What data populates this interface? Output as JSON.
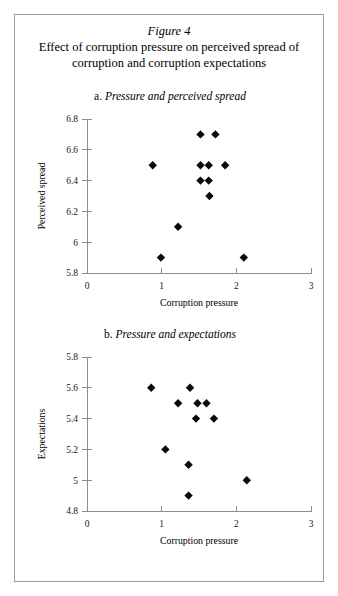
{
  "figure": {
    "number_label": "Figure 4",
    "title": "Effect of corruption pressure on perceived spread of corruption and corruption expectations",
    "title_line1": "Effect of corruption pressure on perceived spread of",
    "title_line2": "corruption and corruption expectations"
  },
  "panel_a": {
    "letter": "a.",
    "title_text": "Pressure and perceived spread",
    "full_title": "a. Pressure and perceived spread"
  },
  "panel_b": {
    "letter": "b.",
    "title_text": "Pressure and expectations",
    "full_title": "b. Pressure and expectations"
  },
  "chart_data": [
    {
      "id": "panel-a",
      "type": "scatter",
      "title": "a. Pressure and perceived spread",
      "xlabel": "Corruption pressure",
      "ylabel": "Perceived spread",
      "xlim": [
        0,
        3
      ],
      "ylim": [
        5.8,
        6.8
      ],
      "xticks": [
        0,
        1,
        2,
        3
      ],
      "xticklabels": [
        "0",
        "1",
        "2",
        "3"
      ],
      "yticks": [
        5.8,
        6.0,
        6.2,
        6.4,
        6.6,
        6.8
      ],
      "yticklabels": [
        "5.8",
        "6",
        "6.2",
        "6.4",
        "6.6",
        "6.8"
      ],
      "grid": false,
      "legend": false,
      "marker": "diamond",
      "marker_color": "#0a0a0a",
      "points": [
        {
          "x": 1.52,
          "y": 6.7
        },
        {
          "x": 1.72,
          "y": 6.7
        },
        {
          "x": 0.88,
          "y": 6.5
        },
        {
          "x": 1.52,
          "y": 6.5
        },
        {
          "x": 1.63,
          "y": 6.5
        },
        {
          "x": 1.85,
          "y": 6.5
        },
        {
          "x": 1.52,
          "y": 6.4
        },
        {
          "x": 1.63,
          "y": 6.4
        },
        {
          "x": 1.64,
          "y": 6.3
        },
        {
          "x": 1.22,
          "y": 6.1
        },
        {
          "x": 0.99,
          "y": 5.9
        },
        {
          "x": 2.1,
          "y": 5.9
        }
      ]
    },
    {
      "id": "panel-b",
      "type": "scatter",
      "title": "b. Pressure and expectations",
      "xlabel": "Corruption pressure",
      "ylabel": "Expectations",
      "xlim": [
        0,
        3
      ],
      "ylim": [
        4.8,
        5.8
      ],
      "xticks": [
        0,
        1,
        2,
        3
      ],
      "xticklabels": [
        "0",
        "1",
        "2",
        "3"
      ],
      "yticks": [
        4.8,
        5.0,
        5.2,
        5.4,
        5.6,
        5.8
      ],
      "yticklabels": [
        "4.8",
        "5",
        "5.2",
        "5.4",
        "5.6",
        "5.8"
      ],
      "grid": false,
      "legend": false,
      "marker": "diamond",
      "marker_color": "#0a0a0a",
      "points": [
        {
          "x": 0.86,
          "y": 5.6
        },
        {
          "x": 1.38,
          "y": 5.6
        },
        {
          "x": 1.22,
          "y": 5.5
        },
        {
          "x": 1.48,
          "y": 5.5
        },
        {
          "x": 1.6,
          "y": 5.5
        },
        {
          "x": 1.46,
          "y": 5.4
        },
        {
          "x": 1.7,
          "y": 5.4
        },
        {
          "x": 1.05,
          "y": 5.2
        },
        {
          "x": 1.36,
          "y": 5.1
        },
        {
          "x": 2.14,
          "y": 5.0
        },
        {
          "x": 1.36,
          "y": 4.9
        }
      ]
    }
  ]
}
